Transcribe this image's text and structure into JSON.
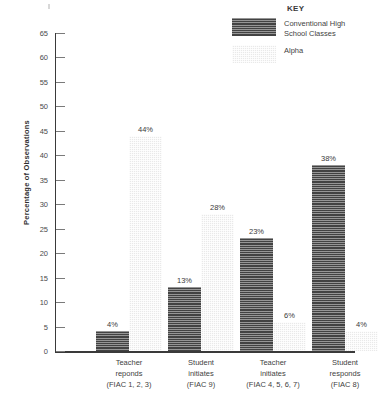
{
  "chart_data": {
    "type": "bar",
    "title": "",
    "xlabel": "",
    "ylabel": "Percentage of Observations",
    "ylim": [
      0,
      65
    ],
    "yticks": [
      0,
      5,
      10,
      15,
      20,
      25,
      30,
      35,
      40,
      45,
      50,
      55,
      60,
      65
    ],
    "grid": false,
    "legend_position": "top-right",
    "legend_title": "KEY",
    "categories": [
      "Teacher reponds (FIAC 1, 2, 3)",
      "Student initiates (FIAC 9)",
      "Teacher initiates (FIAC 4, 5, 6, 7)",
      "Student responds (FIAC 8)"
    ],
    "category_lines": [
      [
        "Teacher",
        "reponds",
        "(FIAC 1, 2, 3)"
      ],
      [
        "Student",
        "initiates",
        "(FIAC 9)"
      ],
      [
        "Teacher",
        "initiates",
        "(FIAC 4, 5, 6, 7)"
      ],
      [
        "Student",
        "responds",
        "(FIAC 8)"
      ]
    ],
    "series": [
      {
        "name": "Conventional High School Classes",
        "name_lines": [
          "Conventional High",
          "School Classes"
        ],
        "color": "#4a4a4a",
        "pattern": "horizontal-lines",
        "values": [
          4,
          13,
          23,
          38
        ],
        "data_labels": [
          "4%",
          "13%",
          "23%",
          "38%"
        ]
      },
      {
        "name": "Alpha",
        "name_lines": [
          "Alpha"
        ],
        "color": "#e9e9e9",
        "pattern": "fine-checker",
        "values": [
          44,
          28,
          6,
          4
        ],
        "data_labels": [
          "44%",
          "28%",
          "6%",
          "4%"
        ]
      }
    ]
  },
  "caption": ""
}
